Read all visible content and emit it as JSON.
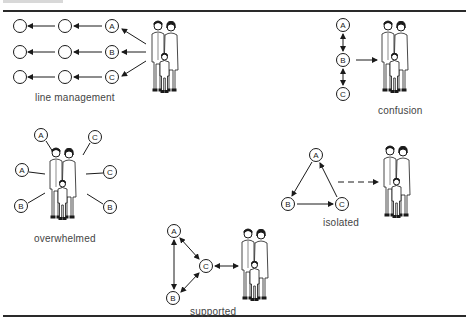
{
  "colors": {
    "ink": "#1a1a1a",
    "caption": "#444444",
    "background": "#ffffff"
  },
  "panels": {
    "line_management": {
      "caption": "line management",
      "node_labels": [
        "A",
        "B",
        "C"
      ]
    },
    "confusion": {
      "caption": "confusion",
      "node_labels": [
        "A",
        "B",
        "C"
      ]
    },
    "overwhelmed": {
      "caption": "overwhelmed",
      "node_labels": [
        "A",
        "C",
        "A",
        "C",
        "B",
        "B"
      ]
    },
    "isolated": {
      "caption": "isolated",
      "node_labels": [
        "A",
        "B",
        "C"
      ]
    },
    "supported": {
      "caption": "supported",
      "node_labels": [
        "A",
        "B",
        "C"
      ]
    }
  },
  "icons": {
    "family": "family-icon"
  }
}
